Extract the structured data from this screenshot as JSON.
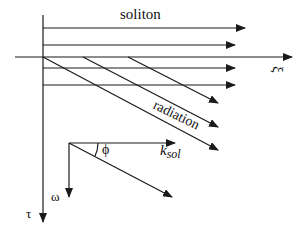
{
  "diagram": {
    "labels": {
      "soliton": "soliton",
      "xi": "ξ",
      "radiation": "radiation",
      "phi": "ϕ",
      "k": "k",
      "k_sub": "sol",
      "omega": "ω",
      "tau": "τ"
    },
    "axes": {
      "horizontal": "ξ",
      "vertical": "τ"
    },
    "soliton_lines": 4,
    "radiation_lines": 3,
    "colors": {
      "stroke": "#1a1a1a",
      "background": "#ffffff"
    }
  }
}
